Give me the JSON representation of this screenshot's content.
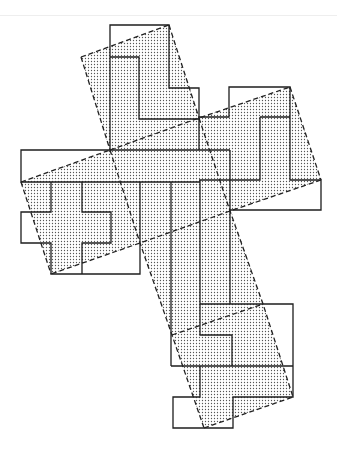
{
  "diagram": {
    "title": "Dissection of squares into cross-shaped pieces",
    "colors": {
      "stroke": "#1e1e1e",
      "dot_fill": "#555555",
      "background": "#ffffff"
    },
    "shaded_tiles": [
      {
        "name": "top-tilted-square",
        "points": "81,57 169,25 199,118 110,150"
      },
      {
        "name": "right-tilted-square",
        "points": "199,118 290,87 321,180 230,211"
      },
      {
        "name": "left-tilted-square",
        "points": "21,182 110,150 140,243 51,274"
      },
      {
        "name": "center-tilted-strip",
        "points": "110,150 199,118 263,304 172,335 140,243"
      },
      {
        "name": "bottom-tilted-square",
        "points": "172,335 263,304 293,397 204,428"
      }
    ],
    "solid_paths": [
      {
        "name": "top-outline",
        "d": "M110,150 L110,25 L169,25 L169,88 L199,88 L199,150"
      },
      {
        "name": "top-inner-l",
        "d": "M110,57 L139,57 L139,119 L199,119"
      },
      {
        "name": "right-outline",
        "d": "M199,117 L229,117 L229,87 L290,87 L290,180 L321,180 L321,210 L230,210"
      },
      {
        "name": "right-inner",
        "d": "M260,117 L290,117 M260,117 L260,180 L199,180"
      },
      {
        "name": "left-outline",
        "d": "M230,150 L21,150 L21,182 L200,182"
      },
      {
        "name": "left-cross",
        "d": "M51,182 L51,212 L21,212 L21,243 L51,243 L51,274 L140,274 L140,182"
      },
      {
        "name": "left-inner",
        "d": "M82,182 L82,212 L111,212 L111,243 L82,243 L82,274"
      },
      {
        "name": "center-vertical-lines",
        "d": "M171,182 L171,366 M200,180 L200,304 M230,150 L230,304"
      },
      {
        "name": "bottom-outline",
        "d": "M200,304 L293,304 L293,397 L233,397 L233,428 L173,428 L173,397 L200,397 L200,366"
      },
      {
        "name": "bottom-inner",
        "d": "M200,304 L200,335 L232,335 L232,366 M171,366 L293,366"
      }
    ],
    "dashed_lines": [
      {
        "name": "top-square-edge",
        "d": "M81,57 L169,25"
      },
      {
        "name": "top-square-left",
        "d": "M81,57 L110,150"
      },
      {
        "name": "top-square-right",
        "d": "M169,25 L199,118"
      },
      {
        "name": "cross-diagonal-1",
        "d": "M110,150 L199,118 L290,87"
      },
      {
        "name": "right-square-right",
        "d": "M290,87 L321,180"
      },
      {
        "name": "right-square-bottom",
        "d": "M321,180 L230,211 L140,243 L51,274"
      },
      {
        "name": "left-square-top",
        "d": "M21,182 L110,150"
      },
      {
        "name": "left-square-left",
        "d": "M21,182 L51,274"
      },
      {
        "name": "strip-left",
        "d": "M110,150 L140,243 L172,335 L204,428"
      },
      {
        "name": "strip-right",
        "d": "M199,118 L230,211 L263,304 L293,397"
      },
      {
        "name": "bottom-square-top",
        "d": "M172,335 L263,304"
      },
      {
        "name": "bottom-square-bottom",
        "d": "M204,428 L293,397"
      }
    ]
  }
}
